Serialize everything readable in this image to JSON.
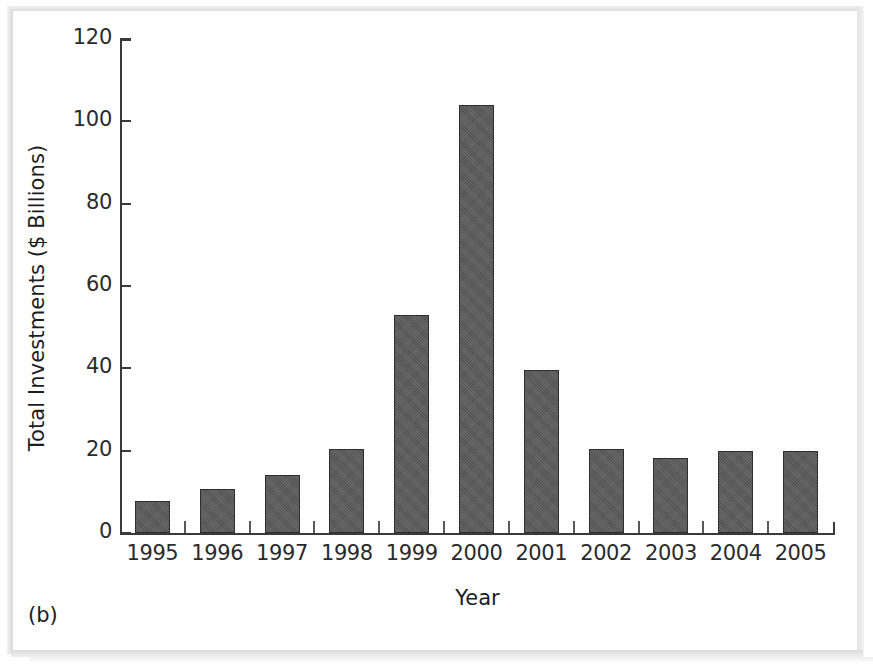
{
  "figure": {
    "caption": "(b)",
    "background_color": "#ffffff",
    "bar_color": "#5a5a5a",
    "bar_border_color": "#2e2e2e",
    "axis_color": "#3a3a3a"
  },
  "chart_data": {
    "type": "bar",
    "title": "",
    "xlabel": "Year",
    "ylabel": "Total Investments ($ Billions)",
    "categories": [
      "1995",
      "1996",
      "1997",
      "1998",
      "1999",
      "2000",
      "2001",
      "2002",
      "2003",
      "2004",
      "2005"
    ],
    "values": [
      7.7,
      10.8,
      14.2,
      20.4,
      53.0,
      104.0,
      39.7,
      20.5,
      18.2,
      20.0,
      20.0
    ],
    "ylim": [
      0,
      120
    ],
    "yticks": [
      0,
      20,
      40,
      60,
      80,
      100,
      120
    ],
    "ytick_labels": [
      "0",
      "20",
      "40",
      "60",
      "80",
      "100",
      "120"
    ],
    "xtick_labels": [
      "1995",
      "1996",
      "1997",
      "1998",
      "1999",
      "2000",
      "2001",
      "2002",
      "2003",
      "2004",
      "2005"
    ],
    "grid": false,
    "legend": null,
    "legend_position": "none",
    "annotations": [
      "(b)"
    ]
  }
}
